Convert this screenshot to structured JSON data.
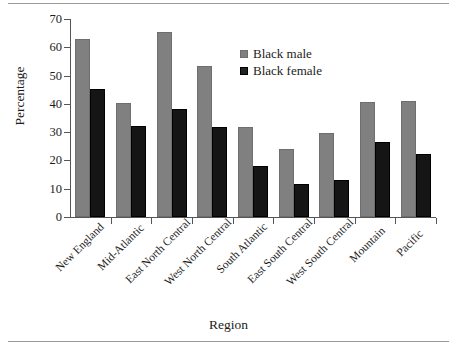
{
  "chart_data": {
    "type": "bar",
    "title": "",
    "xlabel": "Region",
    "ylabel": "Percentage",
    "ylim": [
      0,
      70
    ],
    "ytick_values": [
      0,
      10,
      20,
      30,
      40,
      50,
      60,
      70
    ],
    "ytick_labels": [
      "0",
      "10",
      "20",
      "30",
      "40",
      "50",
      "60",
      "70"
    ],
    "grid": false,
    "legend_position": "inside upper-right",
    "categories": [
      "New England",
      "Mid-Atlantic",
      "East North Central",
      "West North Central",
      "South Atlantic",
      "East South Central",
      "West South Central",
      "Mountain",
      "Pacific"
    ],
    "series": [
      {
        "name": "Black male",
        "color": "#808080",
        "values": [
          63.0,
          40.3,
          65.5,
          53.5,
          32.0,
          24.0,
          29.7,
          40.7,
          41.0
        ]
      },
      {
        "name": "Black female",
        "color": "#151515",
        "values": [
          45.2,
          32.1,
          38.3,
          31.7,
          18.0,
          11.5,
          13.2,
          26.6,
          22.4
        ]
      }
    ]
  },
  "legend": {
    "items": [
      {
        "label": "Black male",
        "swatch": "male"
      },
      {
        "label": "Black female",
        "swatch": "female"
      }
    ]
  }
}
